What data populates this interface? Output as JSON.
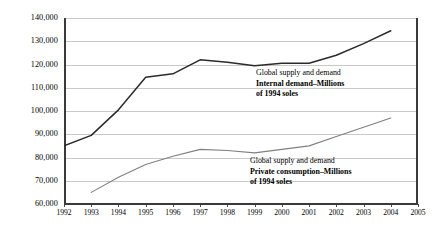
{
  "chart_data": {
    "type": "line",
    "title": "",
    "xlabel": "",
    "ylabel": "",
    "x": [
      1992,
      1993,
      1994,
      1995,
      1996,
      1997,
      1998,
      1999,
      2000,
      2001,
      2002,
      2003,
      2004,
      2005
    ],
    "xtick_labels": [
      "1992",
      "1993",
      "1994",
      "1995",
      "1996",
      "1997",
      "1998",
      "1999",
      "2000",
      "2001",
      "2002",
      "2003",
      "2004",
      "2005"
    ],
    "ytick_labels": [
      "60,000",
      "70,000",
      "80,000",
      "90,000",
      "100,000",
      "110,000",
      "120,000",
      "130,000",
      "140,000"
    ],
    "ytick_values": [
      60000,
      70000,
      80000,
      90000,
      100000,
      110000,
      120000,
      130000,
      140000
    ],
    "ylim": [
      60000,
      140000
    ],
    "xlim": [
      1992,
      2005
    ],
    "grid": true,
    "legend_position": "inline-annotations",
    "series": [
      {
        "name": "Internal demand",
        "color": "#2b2b2b",
        "x": [
          1992,
          1993,
          1994,
          1995,
          1996,
          1997,
          1998,
          1999,
          2000,
          2001,
          2002,
          2003,
          2004
        ],
        "values": [
          85000,
          89500,
          100500,
          114500,
          116000,
          122000,
          121000,
          119500,
          120500,
          120500,
          124000,
          129000,
          134500
        ]
      },
      {
        "name": "Private consumption",
        "color": "#808080",
        "x": [
          1993,
          1994,
          1995,
          1996,
          1997,
          1998,
          1999,
          2000,
          2001,
          2002,
          2003,
          2004
        ],
        "values": [
          65000,
          71500,
          77000,
          80500,
          83500,
          83000,
          82000,
          83500,
          85000,
          89000,
          93000,
          97000
        ]
      }
    ],
    "annotations": [
      {
        "id": "upper",
        "title": "Global supply and demand",
        "subtitle": "Internal demand–Millions",
        "subtitle2": "of 1994 soles"
      },
      {
        "id": "lower",
        "title": "Global supply and demand",
        "subtitle": "Private consumption–Millions",
        "subtitle2": "of 1994 soles"
      }
    ]
  }
}
